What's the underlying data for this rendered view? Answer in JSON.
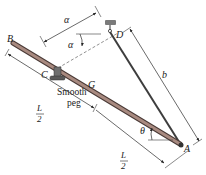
{
  "figure": {
    "points": {
      "A": "A",
      "B": "B",
      "C": "C",
      "D": "D",
      "G": "G"
    },
    "dimensions": {
      "alpha_top": "α",
      "alpha_angle": "α",
      "b": "b",
      "theta": "θ",
      "half_length_num": "L",
      "half_length_den": "2"
    },
    "peg_label_line1": "Smooth",
    "peg_label_line2": "peg",
    "colors": {
      "rod_fill": "#a88a80",
      "rod_edge": "#4a3a36",
      "cable": "#3d3d3d",
      "peg": "#6f6f6f"
    }
  }
}
